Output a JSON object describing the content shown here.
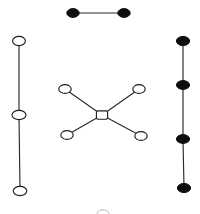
{
  "figure": {
    "background_color": "#ffffff",
    "node_fill_open": "#ffffff",
    "node_fill_filled": "#0d0d0d",
    "node_stroke": "#1d1d1d",
    "edge_color": "#2b2b2b",
    "width": 200,
    "height": 214
  },
  "components": [
    {
      "id": "top-edge-graph",
      "label": "two-node filled edge",
      "node_style": "filled",
      "nodes": [
        {
          "id": "t1",
          "cx": 73,
          "cy": 13,
          "rx": 6.2,
          "ry": 4.4,
          "shape": "ellipse",
          "style": "filled"
        },
        {
          "id": "t2",
          "cx": 124,
          "cy": 13,
          "rx": 6.2,
          "ry": 4.4,
          "shape": "ellipse",
          "style": "filled"
        }
      ],
      "edges": [
        {
          "from": "t1",
          "to": "t2"
        }
      ]
    },
    {
      "id": "left-path-graph",
      "label": "three-node open vertical path",
      "node_style": "open",
      "nodes": [
        {
          "id": "l1",
          "cx": 19,
          "cy": 41,
          "rx": 6.4,
          "ry": 4.6,
          "shape": "ellipse",
          "style": "open"
        },
        {
          "id": "l2",
          "cx": 19,
          "cy": 115,
          "rx": 7.0,
          "ry": 4.6,
          "shape": "ellipse",
          "style": "open"
        },
        {
          "id": "l3",
          "cx": 20,
          "cy": 191,
          "rx": 6.8,
          "ry": 4.6,
          "shape": "ellipse",
          "style": "open"
        }
      ],
      "edges": [
        {
          "from": "l1",
          "to": "l2"
        },
        {
          "from": "l2",
          "to": "l3"
        }
      ]
    },
    {
      "id": "center-star-graph",
      "label": "five-node open star",
      "node_style": "open",
      "nodes": [
        {
          "id": "c0",
          "cx": 102,
          "cy": 115,
          "rx": 5.6,
          "ry": 4.2,
          "shape": "rounded-square",
          "style": "open"
        },
        {
          "id": "c1",
          "cx": 65,
          "cy": 89,
          "rx": 6.2,
          "ry": 4.4,
          "shape": "ellipse",
          "style": "open"
        },
        {
          "id": "c2",
          "cx": 139,
          "cy": 89,
          "rx": 6.2,
          "ry": 4.4,
          "shape": "ellipse",
          "style": "open"
        },
        {
          "id": "c3",
          "cx": 67,
          "cy": 135,
          "rx": 6.2,
          "ry": 4.4,
          "shape": "ellipse",
          "style": "open"
        },
        {
          "id": "c4",
          "cx": 141,
          "cy": 136,
          "rx": 6.2,
          "ry": 4.4,
          "shape": "ellipse",
          "style": "open"
        }
      ],
      "edges": [
        {
          "from": "c0",
          "to": "c1"
        },
        {
          "from": "c0",
          "to": "c2"
        },
        {
          "from": "c0",
          "to": "c3"
        },
        {
          "from": "c0",
          "to": "c4"
        }
      ]
    },
    {
      "id": "right-path-graph",
      "label": "four-node filled vertical path",
      "node_style": "filled",
      "nodes": [
        {
          "id": "r1",
          "cx": 183,
          "cy": 41,
          "rx": 6.6,
          "ry": 4.6,
          "shape": "ellipse",
          "style": "filled"
        },
        {
          "id": "r2",
          "cx": 183,
          "cy": 85,
          "rx": 6.6,
          "ry": 4.4,
          "shape": "ellipse",
          "style": "filled"
        },
        {
          "id": "r3",
          "cx": 183,
          "cy": 139,
          "rx": 6.6,
          "ry": 4.4,
          "shape": "ellipse",
          "style": "filled"
        },
        {
          "id": "r4",
          "cx": 184,
          "cy": 188,
          "rx": 6.6,
          "ry": 4.6,
          "shape": "ellipse",
          "style": "filled"
        }
      ],
      "edges": [
        {
          "from": "r1",
          "to": "r2"
        },
        {
          "from": "r2",
          "to": "r3"
        },
        {
          "from": "r3",
          "to": "r4"
        }
      ]
    },
    {
      "id": "bottom-partial-node",
      "label": "faint cropped node at bottom edge",
      "node_style": "faint",
      "nodes": [
        {
          "id": "b1",
          "cx": 103,
          "cy": 214,
          "rx": 6.0,
          "ry": 4.2,
          "shape": "ellipse",
          "style": "faint"
        }
      ],
      "edges": []
    }
  ]
}
